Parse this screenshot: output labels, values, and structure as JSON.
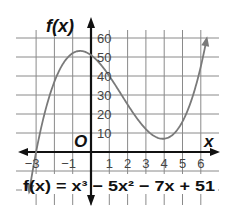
{
  "chart_data": {
    "type": "line",
    "title": "",
    "function": "f(x) = x^3 - 5x^2 - 7x + 51",
    "coefficients": [
      1,
      -5,
      -7,
      51
    ],
    "xlabel": "x",
    "ylabel": "f(x)",
    "origin_label": "O",
    "x_ticks": [
      -3,
      -1,
      1,
      2,
      3,
      4,
      5,
      6
    ],
    "x_tick_labels": [
      "−3",
      "−1",
      "1",
      "2",
      "3",
      "4",
      "5",
      "6"
    ],
    "y_ticks": [
      10,
      20,
      30,
      40,
      50,
      60
    ],
    "y_tick_labels": [
      "10",
      "20",
      "30",
      "40",
      "50",
      "60"
    ],
    "xlim": [
      -4,
      7
    ],
    "ylim": [
      -20,
      70
    ],
    "grid": true,
    "x_grid_step": 1,
    "y_grid_step": 10,
    "domain_plotted": [
      -3.35,
      6.3
    ],
    "key_points": [
      {
        "x": -3,
        "y": 0,
        "note": "x-intercept"
      },
      {
        "x": -0.57,
        "y": 53.1,
        "note": "relative maximum"
      },
      {
        "x": 0,
        "y": 51,
        "note": "y-intercept"
      },
      {
        "x": 3.9,
        "y": 7.0,
        "note": "relative minimum"
      },
      {
        "x": 6,
        "y": 45
      }
    ],
    "series": [
      {
        "name": "f(x)",
        "x": [
          -3,
          -2,
          -1,
          0,
          1,
          2,
          3,
          4,
          5,
          6
        ],
        "values": [
          0,
          37,
          52,
          51,
          40,
          25,
          12,
          7,
          16,
          45
        ]
      }
    ],
    "colors": {
      "curve": "#7a7a7a",
      "axis": "#111111",
      "grid": "#8a8a8a"
    }
  },
  "labels": {
    "y_axis": "f(x)",
    "x_axis": "x",
    "origin": "O",
    "equation": "f(x) = x³ − 5x² − 7x + 51"
  }
}
